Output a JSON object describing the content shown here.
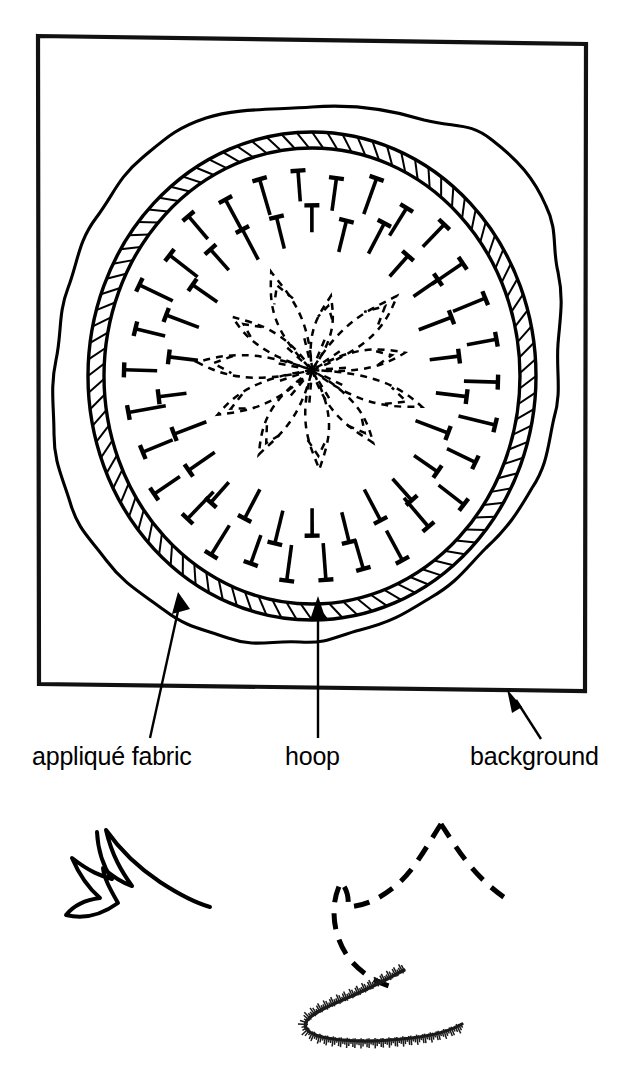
{
  "figure": {
    "medium": "line drawing",
    "ink_color": "#000000",
    "paper_color": "#ffffff"
  },
  "labels": [
    {
      "id": "applique-fabric",
      "text": "appliqué fabric",
      "x": 32,
      "y": 765,
      "points_to": "wavy fabric edge at lower-left of hoop",
      "leader": {
        "from_x": 150,
        "from_y": 738,
        "to_x": 178,
        "to_y": 596,
        "arrow": "up-right"
      }
    },
    {
      "id": "hoop",
      "text": "hoop",
      "x": 285,
      "y": 765,
      "points_to": "hatched ring band at bottom of hoop",
      "leader": {
        "from_x": 318,
        "from_y": 738,
        "to_x": 318,
        "to_y": 600,
        "arrow": "up"
      }
    },
    {
      "id": "background",
      "text": "background",
      "x": 470,
      "y": 765,
      "points_to": "outer rectangular background panel edge",
      "leader": {
        "from_x": 540,
        "from_y": 738,
        "to_x": 510,
        "to_y": 693,
        "arrow": "up-left"
      }
    }
  ],
  "background_panel": {
    "name": "background fabric panel",
    "corners": [
      {
        "x": 38,
        "y": 36
      },
      {
        "x": 586,
        "y": 44
      },
      {
        "x": 585,
        "y": 691
      },
      {
        "x": 39,
        "y": 684
      }
    ]
  },
  "hoop_assembly": {
    "center_x": 312,
    "center_y": 375,
    "fabric_edge": {
      "radius_x": 248,
      "radius_y": 268,
      "style": "wavy irregular outline"
    },
    "hoop_band": {
      "outer_radius_x": 222,
      "outer_radius_y": 242,
      "band_width": 15,
      "hatch_count": 92
    },
    "pins": {
      "rings": 2,
      "outer_ring_count": 30,
      "inner_ring_count": 26,
      "style": "T-headed straight pins pointing inward"
    }
  },
  "center_motif": {
    "name": "dashed appliqué flower pattern",
    "style": "dashed outline",
    "petals": 11,
    "center_x": 312,
    "center_y": 370,
    "radius": 120
  },
  "swatches": [
    {
      "id": "solid-motif",
      "caption_style": "solid line petal shape",
      "center_x": 130,
      "center_y": 880
    },
    {
      "id": "dashed-motif",
      "caption_style": "dashed line petal shape",
      "center_x": 430,
      "center_y": 880
    },
    {
      "id": "stitched-edge",
      "caption_style": "satin / blanket stitched edge",
      "center_x": 385,
      "center_y": 1005
    }
  ]
}
